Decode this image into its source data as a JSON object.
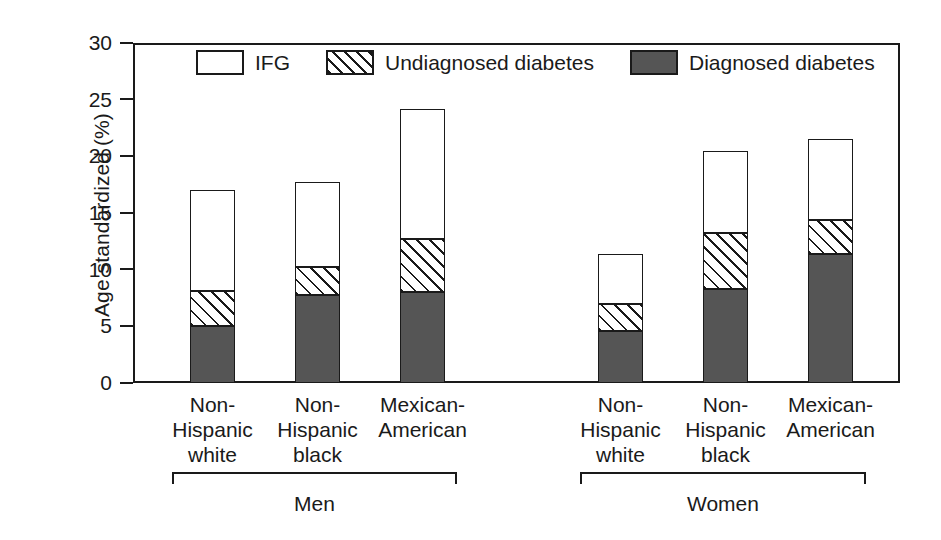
{
  "chart_data": {
    "type": "bar",
    "subtype": "stacked-grouped",
    "title": "",
    "xlabel": "",
    "ylabel": "Age standardized (%)",
    "ylim": [
      0,
      30
    ],
    "yticks": [
      0,
      5,
      10,
      15,
      20,
      25,
      30
    ],
    "ytick_labels": [
      "0",
      "5",
      "10",
      "15",
      "20",
      "25",
      "30"
    ],
    "grid": false,
    "legend_position": "top-inside",
    "categories": [
      "Non-Hispanic white",
      "Non-Hispanic black",
      "Mexican-American",
      "Non-Hispanic white",
      "Non-Hispanic black",
      "Mexican-American"
    ],
    "groups": [
      {
        "label": "Men",
        "categories": [
          "Non-Hispanic white",
          "Non-Hispanic black",
          "Mexican-American"
        ]
      },
      {
        "label": "Women",
        "categories": [
          "Non-Hispanic white",
          "Non-Hispanic black",
          "Mexican-American"
        ]
      }
    ],
    "series": [
      {
        "name": "Diagnosed diabetes",
        "fill": "solid-gray",
        "color": "#555555",
        "values": [
          5.0,
          7.8,
          8.0,
          4.6,
          8.3,
          11.4
        ]
      },
      {
        "name": "Undiagnosed diabetes",
        "fill": "diagonal-hatch",
        "color": "#ffffff",
        "values": [
          3.1,
          2.4,
          4.7,
          2.4,
          4.9,
          3.0
        ]
      },
      {
        "name": "IFG",
        "fill": "white",
        "color": "#ffffff",
        "values": [
          8.9,
          7.5,
          11.5,
          4.4,
          7.3,
          7.1
        ]
      }
    ],
    "totals": [
      17.0,
      17.7,
      24.2,
      11.4,
      20.5,
      21.5
    ]
  },
  "legend": {
    "items": [
      {
        "label": "IFG",
        "swatch": "white-box"
      },
      {
        "label": "Undiagnosed diabetes",
        "swatch": "hatched-box"
      },
      {
        "label": "Diagnosed diabetes",
        "swatch": "gray-box"
      }
    ]
  },
  "axis": {
    "y_title": "Age standardized (%)",
    "ticks": [
      {
        "value": 30,
        "label": "30"
      },
      {
        "value": 25,
        "label": "25"
      },
      {
        "value": 20,
        "label": "20"
      },
      {
        "value": 15,
        "label": "15"
      },
      {
        "value": 10,
        "label": "10"
      },
      {
        "value": 5,
        "label": "5"
      },
      {
        "value": 0,
        "label": "0"
      }
    ]
  },
  "x_categories": [
    {
      "line1": "Non-",
      "line2": "Hispanic",
      "line3": "white"
    },
    {
      "line1": "Non-",
      "line2": "Hispanic",
      "line3": "black"
    },
    {
      "line1": "Mexican-",
      "line2": "American",
      "line3": ""
    },
    {
      "line1": "Non-",
      "line2": "Hispanic",
      "line3": "white"
    },
    {
      "line1": "Non-",
      "line2": "Hispanic",
      "line3": "black"
    },
    {
      "line1": "Mexican-",
      "line2": "American",
      "line3": ""
    }
  ],
  "groups": [
    {
      "label": "Men"
    },
    {
      "label": "Women"
    }
  ],
  "colors": {
    "ink": "#1a1a1a",
    "diagnosed": "#555555",
    "background": "#ffffff"
  }
}
